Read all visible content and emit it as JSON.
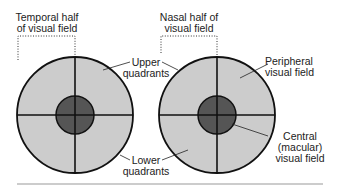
{
  "colors": {
    "outer_field": "#cccccc",
    "macula": "#555555",
    "stroke": "#111111",
    "rule": "#9a9a9a",
    "text": "#222222"
  },
  "left_field": {
    "bracket_label_line1": "Temporal half",
    "bracket_label_line2": "of visual field"
  },
  "right_field": {
    "bracket_label_line1": "Nasal half of",
    "bracket_label_line2": "visual field"
  },
  "labels": {
    "upper_line1": "Upper",
    "upper_line2": "quadrants",
    "lower_line1": "Lower",
    "lower_line2": "quadrants",
    "peripheral_line1": "Peripheral",
    "peripheral_line2": "visual field",
    "central_line1": "Central",
    "central_line2": "(macular)",
    "central_line3": "visual field"
  }
}
